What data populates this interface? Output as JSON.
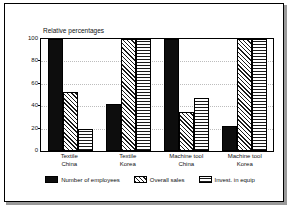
{
  "chart_data": {
    "type": "bar",
    "title": "Relative percentages",
    "xlabel": "",
    "ylabel": "",
    "ylim": [
      0,
      100
    ],
    "yticks": [
      0,
      20,
      40,
      60,
      80,
      100
    ],
    "grid": true,
    "legend_position": "bottom",
    "categories": [
      "Textile\nChina",
      "Textile\nKorea",
      "Machine tool\nChina",
      "Machine tool\nKorea"
    ],
    "category_lines": [
      [
        "Textile",
        "China"
      ],
      [
        "Textile",
        "Korea"
      ],
      [
        "Machine tool",
        "China"
      ],
      [
        "Machine tool",
        "Korea"
      ]
    ],
    "series": [
      {
        "name": "Number of employees",
        "pattern": "solid-black",
        "values": [
          100,
          42,
          100,
          22
        ]
      },
      {
        "name": "Overall sales",
        "pattern": "diagonal-hatch",
        "values": [
          53,
          100,
          35,
          100
        ]
      },
      {
        "name": "Invest. in equip",
        "pattern": "cross-hatch",
        "values": [
          20,
          100,
          47,
          100
        ]
      }
    ]
  },
  "colors": {
    "series_1": "#0d0d0d",
    "hatch": "#1a1a1a",
    "background": "#ffffff",
    "axis": "#000000",
    "grid": "#bdbdbd",
    "frame_shadow": "#9a9a9a"
  }
}
